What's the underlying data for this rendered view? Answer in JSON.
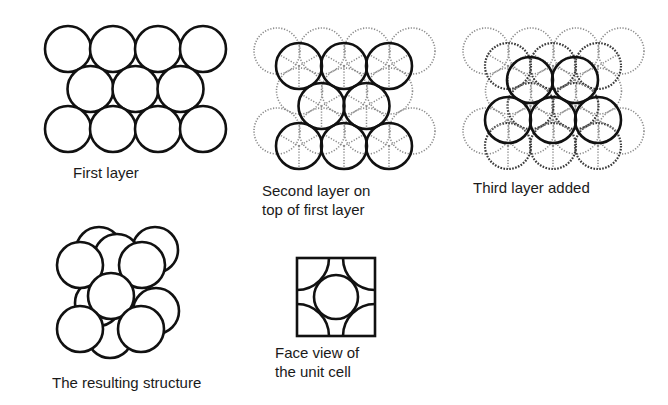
{
  "panels": {
    "first_layer": {
      "label": "First layer",
      "layer_row_counts": [
        4,
        3,
        4
      ]
    },
    "second_layer": {
      "label_line1": "Second layer on",
      "label_line2": "top of first layer",
      "layer_row_counts": [
        3,
        2,
        3
      ]
    },
    "third_layer": {
      "label": "Third layer added",
      "layer_row_counts": [
        2,
        3
      ]
    },
    "resulting_structure": {
      "label": "The resulting structure"
    },
    "unit_cell_face": {
      "label_line1": "Face view of",
      "label_line2": "the unit cell"
    }
  },
  "legend_styles": {
    "first_layer_in_stack": "light dotted outline",
    "second_layer_in_stack": "dark dotted outline",
    "top_layer": "solid outline"
  },
  "colors": {
    "stroke": "#111111",
    "dotted_light": "#8a8a8a",
    "dotted_dark": "#3a3a3a",
    "background": "#ffffff"
  }
}
